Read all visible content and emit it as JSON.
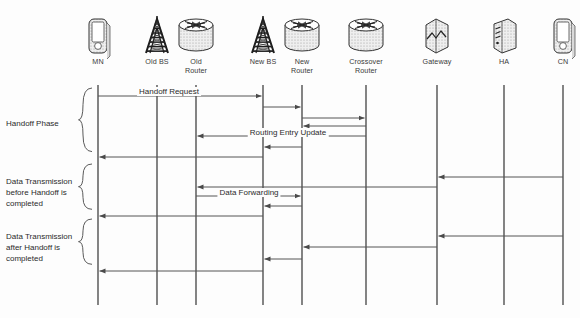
{
  "diagram": {
    "type": "sequence-diagram",
    "background_color": "#fdfdfd",
    "line_color": "#555555",
    "text_color": "#2b2b2b",
    "nodes": [
      {
        "id": "mn",
        "label": "MN",
        "icon": "mobile-phone-icon",
        "x": 98
      },
      {
        "id": "old_bs",
        "label": "Old BS",
        "icon": "antenna-tower-icon",
        "x": 157
      },
      {
        "id": "old_rt",
        "label": "Old\nRouter",
        "icon": "router-cylinder-icon",
        "x": 196
      },
      {
        "id": "new_bs",
        "label": "New BS",
        "icon": "antenna-tower-icon",
        "x": 263
      },
      {
        "id": "new_rt",
        "label": "New\nRouter",
        "icon": "router-cylinder-icon",
        "x": 302
      },
      {
        "id": "cross_rt",
        "label": "Crossover\nRouter",
        "icon": "router-cylinder-icon",
        "x": 366
      },
      {
        "id": "gateway",
        "label": "Gateway",
        "icon": "gateway-box-icon",
        "x": 437
      },
      {
        "id": "ha",
        "label": "HA",
        "icon": "server-icon",
        "x": 504
      },
      {
        "id": "cn",
        "label": "CN",
        "icon": "mobile-phone-icon",
        "x": 563
      }
    ],
    "phases": [
      {
        "id": "handoff",
        "label": "Handoff Phase",
        "y_top": 88,
        "y_bottom": 161,
        "text_y": 118
      },
      {
        "id": "before_handoff",
        "label": "Data Transmission\nbefore Handoff is\ncompleted",
        "y_top": 164,
        "y_bottom": 216,
        "text_y": 176
      },
      {
        "id": "after_handoff",
        "label": "Data Transmission\nafter Handoff is\ncompleted",
        "y_top": 219,
        "y_bottom": 271,
        "text_y": 231
      }
    ],
    "messages": [
      {
        "id": "handoff-request",
        "label": "Handoff Request",
        "from": "mn",
        "to": "new_bs",
        "y": 96,
        "label_x": 169,
        "label_y": 87
      },
      {
        "id": "nbs-to-nrt",
        "label": "",
        "from": "new_bs",
        "to": "new_rt",
        "y": 107,
        "label_x": 0,
        "label_y": 0
      },
      {
        "id": "nrt-to-crt",
        "label": "",
        "from": "new_rt",
        "to": "cross_rt",
        "y": 118,
        "label_x": 0,
        "label_y": 0
      },
      {
        "id": "crt-to-nrt",
        "label": "",
        "from": "cross_rt",
        "to": "new_rt",
        "y": 126,
        "label_x": 0,
        "label_y": 0
      },
      {
        "id": "routing-entry-update",
        "label": "Routing Entry Update",
        "from": "cross_rt",
        "to": "old_rt",
        "y": 136,
        "label_x": 288,
        "label_y": 128
      },
      {
        "id": "nrt-to-nbs",
        "label": "",
        "from": "new_rt",
        "to": "new_bs",
        "y": 147,
        "label_x": 0,
        "label_y": 0
      },
      {
        "id": "nbs-to-mn-1",
        "label": "",
        "from": "new_bs",
        "to": "mn",
        "y": 157,
        "label_x": 0,
        "label_y": 0
      },
      {
        "id": "cn-to-gateway-1",
        "label": "",
        "from": "cn",
        "to": "gateway",
        "y": 177,
        "label_x": 0,
        "label_y": 0
      },
      {
        "id": "gateway-to-ort",
        "label": "",
        "from": "gateway",
        "to": "old_rt",
        "y": 187,
        "label_x": 0,
        "label_y": 0
      },
      {
        "id": "data-forwarding",
        "label": "Data Forwarding",
        "from": "old_rt",
        "to": "new_rt",
        "y": 196,
        "label_x": 249,
        "label_y": 188
      },
      {
        "id": "nrt-to-nbs-2",
        "label": "",
        "from": "new_rt",
        "to": "new_bs",
        "y": 206,
        "label_x": 0,
        "label_y": 0
      },
      {
        "id": "nbs-to-mn-2",
        "label": "",
        "from": "new_bs",
        "to": "mn",
        "y": 216,
        "label_x": 0,
        "label_y": 0
      },
      {
        "id": "cn-to-gateway-2",
        "label": "",
        "from": "cn",
        "to": "gateway",
        "y": 236,
        "label_x": 0,
        "label_y": 0
      },
      {
        "id": "gateway-to-nrt",
        "label": "",
        "from": "gateway",
        "to": "new_rt",
        "y": 247,
        "label_x": 0,
        "label_y": 0
      },
      {
        "id": "nrt-to-nbs-3",
        "label": "",
        "from": "new_rt",
        "to": "new_bs",
        "y": 259,
        "label_x": 0,
        "label_y": 0
      },
      {
        "id": "nbs-to-mn-3",
        "label": "",
        "from": "new_bs",
        "to": "mn",
        "y": 271,
        "label_x": 0,
        "label_y": 0
      }
    ],
    "lifeline": {
      "y_top": 85,
      "y_bottom": 305
    }
  }
}
